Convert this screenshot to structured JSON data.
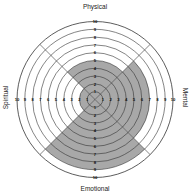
{
  "chart_data": {
    "type": "radial_quadrant",
    "title": "",
    "categories": [
      "Physical",
      "Mental",
      "Emotional",
      "Spiritual"
    ],
    "values": [
      5,
      7,
      9,
      2
    ],
    "scale": {
      "min": 0,
      "max": 10,
      "step": 1
    },
    "tick_labels": [
      "1",
      "2",
      "3",
      "4",
      "5",
      "6",
      "7",
      "8",
      "9",
      "10"
    ],
    "quadrant_angles_deg": {
      "Physical": [
        -45,
        45
      ],
      "Mental": [
        45,
        135
      ],
      "Emotional": [
        135,
        225
      ],
      "Spiritual": [
        225,
        315
      ]
    },
    "grid": true,
    "legend": "none"
  },
  "labels": {
    "top": "Physical",
    "right": "Mental",
    "bottom": "Emotional",
    "left": "Spiritual"
  },
  "colors": {
    "fill": "#a8a8a8",
    "ring": "#333333",
    "background": "#ffffff"
  }
}
